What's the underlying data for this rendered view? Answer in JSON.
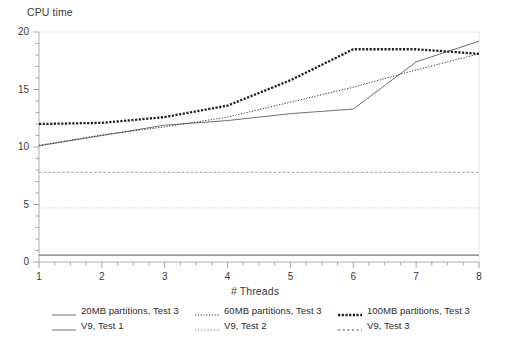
{
  "chart_data": {
    "type": "line",
    "title": "",
    "ylabel": "CPU time",
    "xlabel": "# Threads",
    "xlim": [
      1,
      8
    ],
    "ylim": [
      0,
      20
    ],
    "ytick_labels": [
      "0",
      "5",
      "10",
      "15",
      "20"
    ],
    "ytick_values": [
      0,
      5,
      10,
      15,
      20
    ],
    "yminor_step": 1,
    "xtick_labels": [
      "1",
      "2",
      "3",
      "4",
      "5",
      "6",
      "7",
      "8"
    ],
    "xtick_values": [
      1,
      2,
      3,
      4,
      5,
      6,
      7,
      8
    ],
    "xminor_step": 0.25,
    "grid": false,
    "legend_position": "bottom",
    "x": [
      1,
      2,
      3,
      4,
      5,
      6,
      7,
      8
    ],
    "series": [
      {
        "name": "20MB partitions, Test 3",
        "style": "solid",
        "color": "#555555",
        "values": [
          10.1,
          11.0,
          11.9,
          12.3,
          12.9,
          13.3,
          17.4,
          19.2
        ]
      },
      {
        "name": "60MB partitions, Test 3",
        "style": "fine-dotted",
        "color": "#333333",
        "values": [
          10.15,
          11.05,
          11.75,
          12.6,
          13.9,
          15.2,
          16.7,
          18.1
        ]
      },
      {
        "name": "100MB partitions, Test 3",
        "style": "thick-dotted",
        "color": "#222222",
        "values": [
          12.0,
          12.1,
          12.6,
          13.6,
          15.8,
          18.5,
          18.5,
          18.1
        ]
      },
      {
        "name": "V9, Test 1",
        "style": "solid-reference",
        "color": "#777777",
        "constant": 0.6
      },
      {
        "name": "V9, Test 2",
        "style": "dashed-reference",
        "color": "#9a9a9a",
        "constant": 7.8
      },
      {
        "name": "V9, Test 3",
        "style": "dotted-reference",
        "color": "#b5b5b5",
        "constant": 4.7
      }
    ]
  },
  "legend": {
    "rows": [
      [
        {
          "label": "20MB partitions, Test 3",
          "swatch": "solid"
        },
        {
          "label": "60MB partitions, Test 3",
          "swatch": "fine-dotted"
        },
        {
          "label": "100MB partitions, Test 3",
          "swatch": "thick-dotted"
        }
      ],
      [
        {
          "label": "V9, Test 1",
          "swatch": "solid"
        },
        {
          "label": "V9, Test 2",
          "swatch": "dotted-reference"
        },
        {
          "label": "V9, Test 3",
          "swatch": "dashed-reference"
        }
      ]
    ]
  }
}
